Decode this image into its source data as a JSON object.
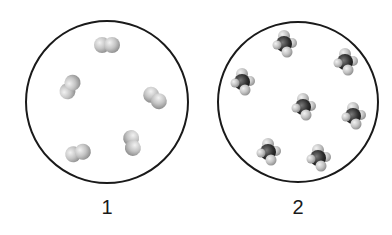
{
  "panels": [
    {
      "label": "1",
      "description": "diatomic molecules",
      "molecules": [
        {
          "x": 107,
          "y": 45,
          "angle": 0
        },
        {
          "x": 70,
          "y": 87,
          "angle": -60
        },
        {
          "x": 155,
          "y": 98,
          "angle": 40
        },
        {
          "x": 132,
          "y": 143,
          "angle": 80
        },
        {
          "x": 78,
          "y": 153,
          "angle": -15
        }
      ]
    },
    {
      "label": "2",
      "description": "tetrahedral molecules (central dark atom with four light atoms)",
      "molecules": [
        {
          "x": 285,
          "y": 44
        },
        {
          "x": 346,
          "y": 62
        },
        {
          "x": 243,
          "y": 82
        },
        {
          "x": 304,
          "y": 107
        },
        {
          "x": 354,
          "y": 116
        },
        {
          "x": 269,
          "y": 152
        },
        {
          "x": 319,
          "y": 158
        }
      ]
    }
  ],
  "colors": {
    "outline": "#1a1a1a",
    "light_atom": "#c8c8c8",
    "dark_atom": "#2a2a2a"
  }
}
